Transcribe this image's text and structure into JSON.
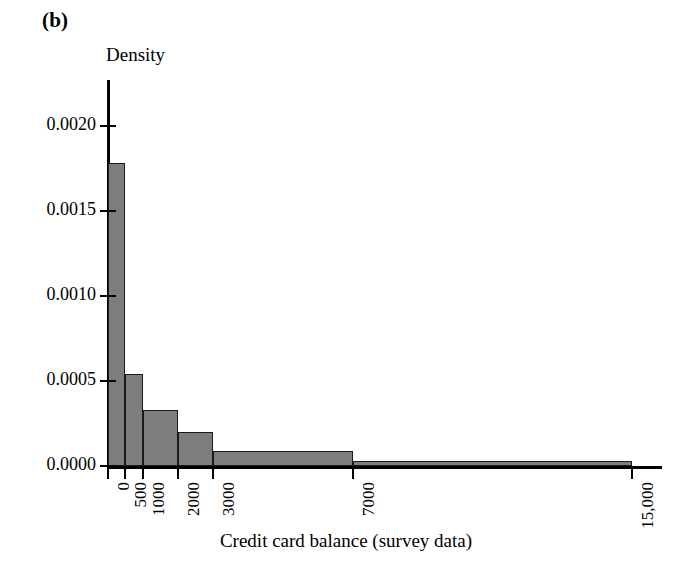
{
  "figure": {
    "panel_label": "(b)",
    "y_axis_title": "Density",
    "x_axis_title": "Credit card balance (survey data)"
  },
  "chart_data": {
    "type": "bar",
    "title": "(b)",
    "xlabel": "Credit card balance (survey data)",
    "ylabel": "Density",
    "xlim": [
      0,
      15000
    ],
    "ylim": [
      0.0,
      0.0021
    ],
    "grid": false,
    "legend": null,
    "x_ticks": [
      0,
      500,
      1000,
      2000,
      3000,
      7000,
      15000
    ],
    "x_tick_labels": [
      "0",
      "500",
      "1000",
      "2000",
      "3000",
      "7000",
      "15,000"
    ],
    "y_ticks": [
      0.0,
      0.0005,
      0.001,
      0.0015,
      0.002
    ],
    "y_tick_labels": [
      "0.0000",
      "0.0005",
      "0.0010",
      "0.0015",
      "0.0020"
    ],
    "bin_edges": [
      0,
      500,
      1000,
      2000,
      3000,
      7000,
      15000
    ],
    "bins": [
      {
        "label": "0-500",
        "left": 0,
        "right": 500,
        "density": 0.00178
      },
      {
        "label": "500-1000",
        "left": 500,
        "right": 1000,
        "density": 0.00054
      },
      {
        "label": "1000-2000",
        "left": 1000,
        "right": 2000,
        "density": 0.00033
      },
      {
        "label": "2000-3000",
        "left": 2000,
        "right": 3000,
        "density": 0.0002
      },
      {
        "label": "3000-7000",
        "left": 3000,
        "right": 7000,
        "density": 9e-05
      },
      {
        "label": "7000-15000",
        "left": 7000,
        "right": 15000,
        "density": 3e-05
      }
    ],
    "values": [
      0.00178,
      0.00054,
      0.00033,
      0.0002,
      9e-05,
      3e-05
    ],
    "categories": [
      "0-500",
      "500-1000",
      "1000-2000",
      "2000-3000",
      "3000-7000",
      "7000-15000"
    ],
    "colors": {
      "bar_fill": "#7d7d7d",
      "bar_edge": "#1a1a1a",
      "axis": "#000000"
    }
  }
}
